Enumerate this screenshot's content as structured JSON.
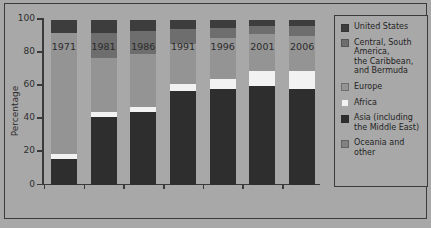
{
  "chart_data": {
    "type": "bar",
    "subtype": "stacked-bar-100",
    "title": "",
    "subtitle": "",
    "xlabel": "",
    "ylabel": "Percentage",
    "ylim": [
      0,
      100
    ],
    "yticks": [
      0,
      20,
      40,
      60,
      80,
      100
    ],
    "ytick_labels": [
      "0",
      "20",
      "40",
      "60",
      "80",
      "100"
    ],
    "grid": false,
    "legend_position": "right",
    "categories": [
      "1971",
      "1981",
      "1986",
      "1991",
      "1996",
      "2001",
      "2006"
    ],
    "series": [
      {
        "name": "Asia (including the Middle East)",
        "color": "#2e2e2e",
        "values": [
          16,
          41,
          44,
          57,
          58,
          60,
          58
        ]
      },
      {
        "name": "Africa",
        "color": "#f2f2f2",
        "values": [
          3,
          3,
          3,
          4,
          6,
          9,
          11
        ]
      },
      {
        "name": "Europe",
        "color": "#949494",
        "values": [
          73,
          33,
          32,
          24,
          25,
          22,
          21
        ]
      },
      {
        "name": "Central, South America, the Caribbean, and Bermuda",
        "color": "#6e6e6e",
        "values": [
          0,
          15,
          14,
          9,
          6,
          5,
          6
        ]
      },
      {
        "name": "United States",
        "color": "#3d3d3d",
        "values": [
          8,
          8,
          7,
          6,
          5,
          4,
          4
        ]
      }
    ]
  },
  "axes": {
    "y_title": "Percentage",
    "y_ticks": [
      "100",
      "80",
      "60",
      "40",
      "20",
      "0"
    ],
    "x_ticks": [
      "1971",
      "1981",
      "1986",
      "1991",
      "1996",
      "2001",
      "2006"
    ]
  },
  "legend": {
    "items": [
      {
        "label": "United States",
        "color": "#3d3d3d"
      },
      {
        "label": "Central, South\nAmerica,\nthe Caribbean,\nand Bermuda",
        "color": "#6e6e6e"
      },
      {
        "label": "Europe",
        "color": "#949494"
      },
      {
        "label": "Africa",
        "color": "#f2f2f2"
      },
      {
        "label": "Asia (including\nthe Middle East)",
        "color": "#2e2e2e"
      },
      {
        "label": "Oceania and\nother",
        "color": "#828282"
      }
    ]
  },
  "theme": {
    "background": "#a8a8a8",
    "border": "#3b3b3b",
    "text": "#1f1f1f"
  }
}
